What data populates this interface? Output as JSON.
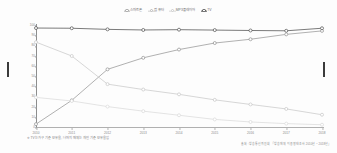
{
  "legend": {
    "position": "top-center",
    "items": [
      {
        "label": "스마트폰",
        "marker": "circle-open",
        "color": "#b5b5b5",
        "key": "smartphone"
      },
      {
        "label": "컴퓨터",
        "marker": "circle-open",
        "color": "#cfcfcf",
        "key": "pc"
      },
      {
        "label": "MP3플레이어",
        "marker": "circle-open",
        "color": "#dadada",
        "key": "mp3"
      },
      {
        "label": "TV",
        "marker": "circle-filled-dark",
        "color": "#555555",
        "key": "tv"
      }
    ]
  },
  "axes": {
    "y_ticks": [
      "100",
      "90",
      "80",
      "70",
      "60",
      "50",
      "40",
      "30",
      "20",
      "10",
      "0"
    ],
    "x_ticks": [
      "2010",
      "2011",
      "2012",
      "2013",
      "2014",
      "2015",
      "2016",
      "2017",
      "2018"
    ],
    "ylim": [
      0,
      100
    ],
    "grid": false
  },
  "footnote": "※ TV는 가구 기준 보유율, 나머지 매체는 개인 기준 보유율임",
  "source": "출처 : 방송통신위원회 「방송매체 이용행태조사 2010년 ~ 2018년」",
  "chart_data": {
    "type": "line",
    "title": "",
    "xlabel": "",
    "ylabel": "",
    "ylim": [
      0,
      100
    ],
    "grid": false,
    "legend_position": "top-center",
    "categories": [
      "2010",
      "2011",
      "2012",
      "2013",
      "2014",
      "2015",
      "2016",
      "2017",
      "2018"
    ],
    "series": [
      {
        "name": "스마트폰",
        "key": "smartphone",
        "color": "#8f8f8f",
        "marker": "circle-open",
        "values": [
          3.8,
          27.1,
          57.5,
          68.8,
          76.9,
          83.3,
          87.0,
          91.8,
          95.2
        ]
      },
      {
        "name": "컴퓨터",
        "key": "pc",
        "color": "#c6c6c6",
        "marker": "circle-open",
        "values": [
          84.2,
          70.6,
          43.0,
          37.7,
          33.0,
          27.6,
          23.1,
          18.7,
          13.0
        ]
      },
      {
        "name": "MP3플레이어",
        "key": "mp3",
        "color": "#d8d8d8",
        "marker": "circle-open",
        "values": [
          30.0,
          26.5,
          21.0,
          16.5,
          12.5,
          8.4,
          5.9,
          4.3,
          3.2
        ]
      },
      {
        "name": "TV",
        "key": "tv",
        "color": "#4f4f4f",
        "marker": "circle-open-dark",
        "values": [
          98.0,
          97.8,
          96.7,
          96.1,
          96.4,
          96.0,
          95.6,
          95.3,
          97.8
        ]
      }
    ]
  }
}
